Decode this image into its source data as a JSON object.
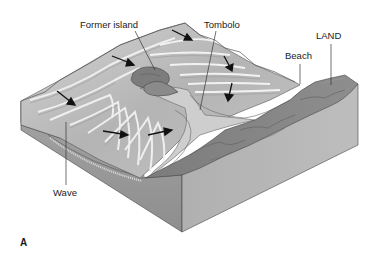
{
  "figure": {
    "panel_letter": "A"
  },
  "labels": {
    "former_island": "Former island",
    "tombolo": "Tombolo",
    "beach": "Beach",
    "land": "LAND",
    "wave": "Wave"
  },
  "colors": {
    "background": "#ffffff",
    "water_light": "#c8c8c8",
    "water_mid": "#a6a6a6",
    "wave_crest": "#eeeeee",
    "block_side_front": "#9b9b9b",
    "block_side_right": "#b3b3b3",
    "block_side_water": "#8c8c8c",
    "land_rock": "#858585",
    "land_dark": "#6e6e6e",
    "island": "#7a7a7a",
    "sand": "#cfcfcf",
    "arrow": "#111111",
    "leader_line": "#333333"
  },
  "wave_arrows": [
    {
      "id": "arrow-top",
      "direction": "southeast"
    },
    {
      "id": "arrow-upper-left",
      "direction": "southeast"
    },
    {
      "id": "arrow-left",
      "direction": "southeast"
    },
    {
      "id": "arrow-right-upper",
      "direction": "south"
    },
    {
      "id": "arrow-right-lower",
      "direction": "south"
    },
    {
      "id": "arrow-bottom-left",
      "direction": "east"
    },
    {
      "id": "arrow-bottom-right",
      "direction": "east"
    }
  ]
}
